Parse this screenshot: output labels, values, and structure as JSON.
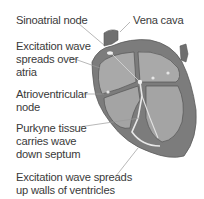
{
  "diagram": {
    "colors": {
      "text": "#3a3a3a",
      "leader_line": "#9a9a9a",
      "heart_outer": "#7c7c7c",
      "heart_wall": "#8e8e8e",
      "heart_inner": "#a9a9a9",
      "conduction_highlight": "#e8e8e8",
      "outline": "#555555"
    },
    "labels": [
      {
        "id": "sinoatrial-node",
        "text": "Sinoatrial node"
      },
      {
        "id": "vena-cava",
        "text": "Vena cava"
      },
      {
        "id": "excitation-atria",
        "text": "Excitation wave\nspreads over\natria"
      },
      {
        "id": "atrioventricular-node",
        "text": "Atrioventricular\nnode"
      },
      {
        "id": "purkyne-tissue",
        "text": "Purkyne tissue\ncarries wave\ndown septum"
      },
      {
        "id": "excitation-ventricles",
        "text": "Excitation wave spreads\nup walls of ventricles"
      }
    ]
  }
}
